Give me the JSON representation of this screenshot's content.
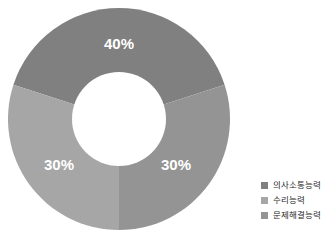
{
  "chart_data": {
    "type": "pie",
    "variant": "donut",
    "title": "",
    "subtitle": "",
    "xlabel": "",
    "ylabel": "",
    "categories": [
      "의사소통능력",
      "수리능력",
      "문제해결능력"
    ],
    "values": [
      40,
      30,
      30
    ],
    "value_labels": [
      "40%",
      "30%",
      "30%"
    ],
    "colors": [
      "#808080",
      "#a6a6a6",
      "#949494"
    ],
    "start_angle_deg": 288,
    "direction": "clockwise",
    "inner_radius_ratio": 0.42,
    "legend_position": "right",
    "grid": false,
    "slices": [
      {
        "name": "의사소통능력",
        "value": 40,
        "label": "40%",
        "color": "#808080",
        "label_x": 119,
        "label_y": 45
      },
      {
        "name": "문제해결능력",
        "value": 30,
        "label": "30%",
        "color": "#949494",
        "label_x": 176,
        "label_y": 166
      },
      {
        "name": "수리능력",
        "value": 30,
        "label": "30%",
        "color": "#a6a6a6",
        "label_x": 59,
        "label_y": 166
      }
    ]
  },
  "legend": {
    "items": [
      {
        "label": "의사소통능력",
        "color": "#808080"
      },
      {
        "label": "수리능력",
        "color": "#a6a6a6"
      },
      {
        "label": "문제해결능력",
        "color": "#949494"
      }
    ]
  },
  "canvas": {
    "background": "#ffffff",
    "hole_color": "#ffffff"
  }
}
